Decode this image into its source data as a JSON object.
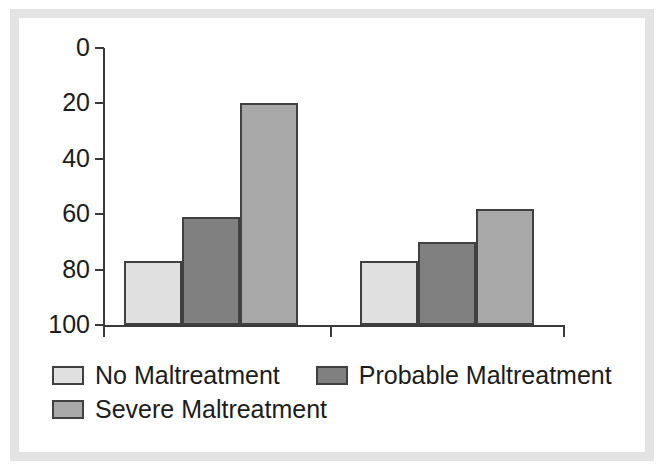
{
  "figure": {
    "background": "#ffffff",
    "frame_color": "#e3e3e3",
    "axis_color": "#3a3a3a",
    "bar_outline_color": "#404040"
  },
  "legend": {
    "rows": [
      [
        {
          "label": "No Maltreatment",
          "color": "#e0e0e0",
          "swatch_name": "legend-swatch-no-maltreatment"
        },
        {
          "label": "Probable Maltreatment",
          "color": "#808080",
          "swatch_name": "legend-swatch-probable-maltreatment"
        }
      ],
      [
        {
          "label": "Severe Maltreatment",
          "color": "#a8a8a8",
          "swatch_name": "legend-swatch-severe-maltreatment"
        }
      ]
    ]
  },
  "axis": {
    "y_ticks": [
      "100",
      "80",
      "60",
      "40",
      "20",
      "0"
    ]
  },
  "chart_data": {
    "type": "bar",
    "title": "",
    "xlabel": "",
    "ylabel": "",
    "ylim": [
      0,
      100
    ],
    "ytick_values": [
      0,
      20,
      40,
      60,
      80,
      100
    ],
    "grid": false,
    "legend_position": "bottom-left",
    "categories": [
      "Group 1",
      "Group 2"
    ],
    "category_labels_visible": false,
    "series": [
      {
        "name": "No Maltreatment",
        "color": "#e0e0e0",
        "values": [
          23,
          23
        ]
      },
      {
        "name": "Probable Maltreatment",
        "color": "#808080",
        "values": [
          39,
          30
        ]
      },
      {
        "name": "Severe Maltreatment",
        "color": "#a8a8a8",
        "values": [
          80,
          42
        ]
      }
    ]
  }
}
